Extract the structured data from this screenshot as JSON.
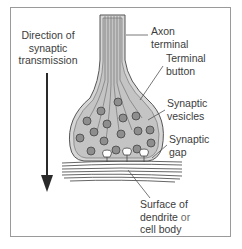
{
  "diagram": {
    "direction_label": [
      "Direction of",
      "synaptic",
      "transmission"
    ],
    "labels": {
      "axon_terminal": [
        "Axon",
        "terminal"
      ],
      "terminal_button": [
        "Terminal",
        "button"
      ],
      "synaptic_vesicles": [
        "Synaptic",
        "vesicles"
      ],
      "synaptic_gap": [
        "Synaptic",
        "gap"
      ],
      "surface": {
        "line1": "Surface of",
        "line2_main": "dendrite",
        "line2_light": " or",
        "line3": "cell body"
      }
    },
    "colors": {
      "frame_border": "#9a9a9a",
      "ink": "#3c3c3c",
      "bulb_fill": "#c9c9c9",
      "vesicle_fill": "#8e8e8e",
      "arrow": "#2a2a2a"
    }
  }
}
